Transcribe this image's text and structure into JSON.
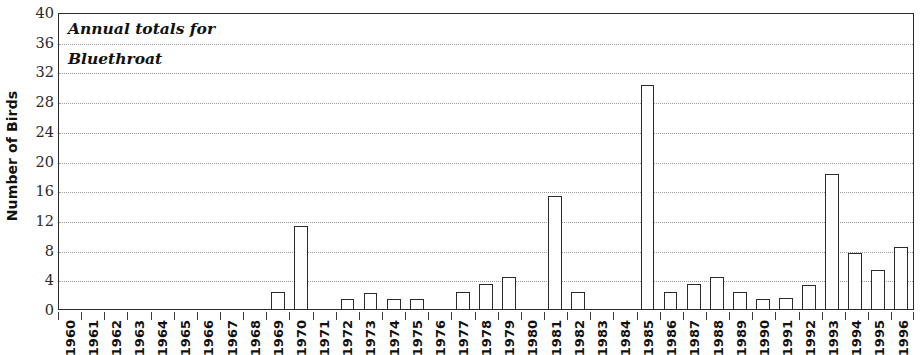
{
  "chart_data": {
    "type": "bar",
    "title_lines": [
      "Annual totals for",
      "Bluethroat"
    ],
    "xlabel": "",
    "ylabel": "Number of Birds",
    "ylim": [
      0,
      40
    ],
    "ytick_step": 4,
    "yticks": [
      40,
      36,
      32,
      28,
      24,
      20,
      16,
      12,
      8,
      4,
      0
    ],
    "ytick_labels": [
      "40",
      "36",
      "32",
      "28",
      "24",
      "20",
      "16",
      "12",
      "8",
      "4",
      "0"
    ],
    "grid": true,
    "grid_axis": "y",
    "grid_style": "dotted",
    "legend": null,
    "bar_fill": "#ffffff",
    "bar_edge": "#2b2b2b",
    "categories": [
      "1960",
      "1961",
      "1962",
      "1963",
      "1964",
      "1965",
      "1966",
      "1967",
      "1968",
      "1969",
      "1970",
      "1971",
      "1972",
      "1973",
      "1974",
      "1975",
      "1976",
      "1977",
      "1978",
      "1979",
      "1980",
      "1981",
      "1982",
      "1983",
      "1984",
      "1985",
      "1986",
      "1987",
      "1988",
      "1989",
      "1990",
      "1991",
      "1992",
      "1993",
      "1994",
      "1995",
      "1996"
    ],
    "values": [
      0,
      0,
      0,
      0,
      0,
      0,
      0,
      0,
      0,
      2.3,
      11.2,
      0,
      1.3,
      2.2,
      1.3,
      1.4,
      0,
      2.3,
      3.4,
      4.3,
      0,
      15.2,
      2.3,
      0,
      0,
      30.2,
      2.3,
      3.4,
      4.3,
      2.3,
      1.3,
      1.5,
      3.3,
      18.2,
      7.5,
      5.3,
      8.3
    ]
  }
}
